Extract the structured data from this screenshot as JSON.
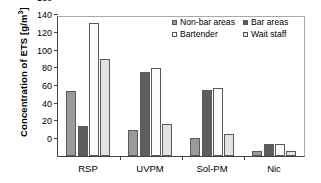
{
  "chart_data": {
    "type": "bar",
    "title": "",
    "xlabel": "",
    "ylabel": "Concentration of ETS [g/m",
    "ylabel_superscript": "3",
    "ylabel_suffix": "]",
    "categories": [
      "RSP",
      "UVPM",
      "Sol-PM",
      "Nic"
    ],
    "ylim": [
      0,
      160
    ],
    "yticks": [
      0,
      20,
      40,
      60,
      80,
      100,
      120,
      140,
      160
    ],
    "grid": false,
    "legend_position": "top-right",
    "series": [
      {
        "name": "Non-bar areas",
        "color": "#9a9a9a",
        "values": [
          74,
          30,
          20,
          6
        ]
      },
      {
        "name": "Bar areas",
        "color": "#5e5e5e",
        "values": [
          34.5,
          95.5,
          75,
          14
        ]
      },
      {
        "name": "Bartender",
        "color": "#ffffff",
        "values": [
          151,
          99.5,
          77,
          13.5
        ]
      },
      {
        "name": "Wait staff",
        "color": "#e2e2e2",
        "values": [
          110,
          36.5,
          25.5,
          6
        ]
      }
    ]
  }
}
